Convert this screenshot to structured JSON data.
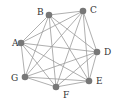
{
  "diagram": {
    "type": "complete-graph",
    "colors": {
      "node": "#777777",
      "edge": "#9a9a9a",
      "label": "#333333",
      "background": "#ffffff"
    },
    "nodes": [
      {
        "id": "A",
        "label": "A",
        "x": 21,
        "y": 43,
        "lx": 12,
        "ly": 46
      },
      {
        "id": "B",
        "label": "B",
        "x": 49,
        "y": 15,
        "lx": 37,
        "ly": 15
      },
      {
        "id": "C",
        "label": "C",
        "x": 83,
        "y": 11,
        "lx": 90,
        "ly": 13
      },
      {
        "id": "D",
        "label": "D",
        "x": 97,
        "y": 52,
        "lx": 104,
        "ly": 55
      },
      {
        "id": "E",
        "label": "E",
        "x": 89,
        "y": 81,
        "lx": 96,
        "ly": 84
      },
      {
        "id": "F",
        "label": "F",
        "x": 56,
        "y": 87,
        "lx": 63,
        "ly": 98
      },
      {
        "id": "G",
        "label": "G",
        "x": 25,
        "y": 77,
        "lx": 11,
        "ly": 81
      }
    ],
    "edges": [
      [
        "A",
        "B"
      ],
      [
        "A",
        "C"
      ],
      [
        "A",
        "D"
      ],
      [
        "A",
        "E"
      ],
      [
        "A",
        "F"
      ],
      [
        "A",
        "G"
      ],
      [
        "B",
        "C"
      ],
      [
        "B",
        "D"
      ],
      [
        "B",
        "E"
      ],
      [
        "B",
        "F"
      ],
      [
        "B",
        "G"
      ],
      [
        "C",
        "D"
      ],
      [
        "C",
        "E"
      ],
      [
        "C",
        "F"
      ],
      [
        "C",
        "G"
      ],
      [
        "D",
        "E"
      ],
      [
        "D",
        "F"
      ],
      [
        "D",
        "G"
      ],
      [
        "E",
        "F"
      ],
      [
        "E",
        "G"
      ],
      [
        "F",
        "G"
      ]
    ]
  }
}
